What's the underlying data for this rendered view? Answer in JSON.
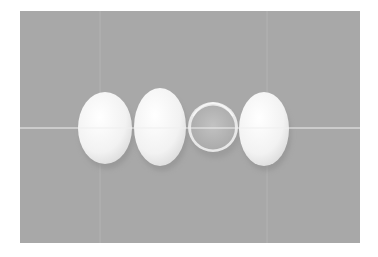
{
  "image": {
    "description": "Three white eggs and one broken eggshell half arranged in a row on a gray background",
    "colors": {
      "page_background": "#ffffff",
      "backdrop": "#a8a8a8",
      "egg": "#f4f4f4",
      "shell_inner": "#b9b9b9",
      "guide_line": "#efefef"
    },
    "objects": [
      {
        "name": "egg-1",
        "cx": 105,
        "cy": 128,
        "rx": 27,
        "ry": 36
      },
      {
        "name": "egg-2",
        "cx": 160,
        "cy": 127,
        "rx": 26,
        "ry": 39
      },
      {
        "name": "eggshell-half",
        "cx": 213,
        "cy": 127,
        "r": 25
      },
      {
        "name": "egg-3",
        "cx": 264,
        "cy": 129,
        "rx": 25,
        "ry": 37
      }
    ]
  }
}
